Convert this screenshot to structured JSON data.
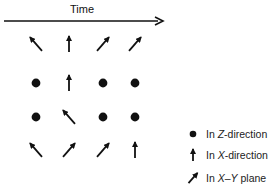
{
  "timeline": {
    "label": "Time"
  },
  "grid": {
    "rows": [
      [
        "xy-left",
        "x",
        "xy-right",
        "xy-right"
      ],
      [
        "z",
        "x",
        "z",
        "z"
      ],
      [
        "z",
        "xy-left",
        "z",
        "z"
      ],
      [
        "xy-left",
        "xy-right",
        "xy-right",
        "x"
      ]
    ]
  },
  "legend": {
    "items": [
      {
        "symbol": "dot",
        "prefix": "In ",
        "axis": "Z",
        "suffix": "-direction"
      },
      {
        "symbol": "up-arrow",
        "prefix": "In ",
        "axis": "X",
        "suffix": "-direction"
      },
      {
        "symbol": "diagonal-arrow",
        "prefix": "In ",
        "axis": "X–Y",
        "suffix": " plane"
      }
    ]
  }
}
